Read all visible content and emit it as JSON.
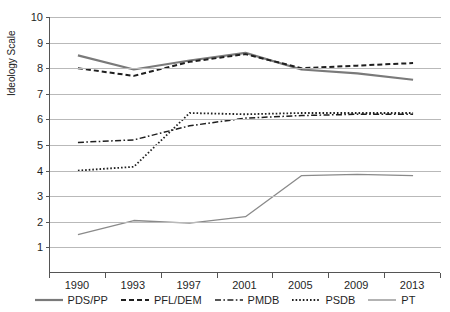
{
  "chart_data": {
    "type": "line",
    "title": "",
    "xlabel": "",
    "ylabel": "Ideology Scale",
    "x": [
      1990,
      1993,
      1997,
      2001,
      2005,
      2009,
      2013
    ],
    "categories": [
      "1990",
      "1993",
      "1997",
      "2001",
      "2005",
      "2009",
      "2013"
    ],
    "ylim": [
      0,
      10
    ],
    "yticks": [
      1,
      2,
      3,
      4,
      5,
      6,
      7,
      8,
      9,
      10
    ],
    "ytick_labels": [
      "1",
      "2",
      "3",
      "4",
      "5",
      "6",
      "7",
      "8",
      "9",
      "10"
    ],
    "grid": "horizontal",
    "legend_position": "bottom",
    "series": [
      {
        "name": "PDS/PP",
        "style": "solid",
        "color": "#7a7a7a",
        "width": 2.2,
        "values": [
          8.5,
          7.95,
          8.3,
          8.6,
          7.95,
          7.8,
          7.55
        ]
      },
      {
        "name": "PFL/DEM",
        "style": "dashed",
        "color": "#1f1f1f",
        "width": 2.0,
        "values": [
          8.0,
          7.7,
          8.25,
          8.55,
          8.0,
          8.1,
          8.2
        ]
      },
      {
        "name": "PMDB",
        "style": "dashdot",
        "color": "#1f1f1f",
        "width": 1.5,
        "values": [
          5.1,
          5.2,
          5.75,
          6.05,
          6.15,
          6.2,
          6.2
        ]
      },
      {
        "name": "PSDB",
        "style": "dotted",
        "color": "#1f1f1f",
        "width": 1.8,
        "values": [
          4.0,
          4.15,
          6.25,
          6.2,
          6.25,
          6.25,
          6.25
        ]
      },
      {
        "name": "PT",
        "style": "solid",
        "color": "#8a8a8a",
        "width": 1.3,
        "values": [
          1.5,
          2.05,
          1.95,
          2.2,
          3.8,
          3.85,
          3.8
        ]
      }
    ]
  },
  "axes": {
    "y_axis_title": "Ideology Scale"
  },
  "legend": {
    "items": [
      {
        "label": "PDS/PP"
      },
      {
        "label": "PFL/DEM"
      },
      {
        "label": "PMDB"
      },
      {
        "label": "PSDB"
      },
      {
        "label": "PT"
      }
    ]
  }
}
